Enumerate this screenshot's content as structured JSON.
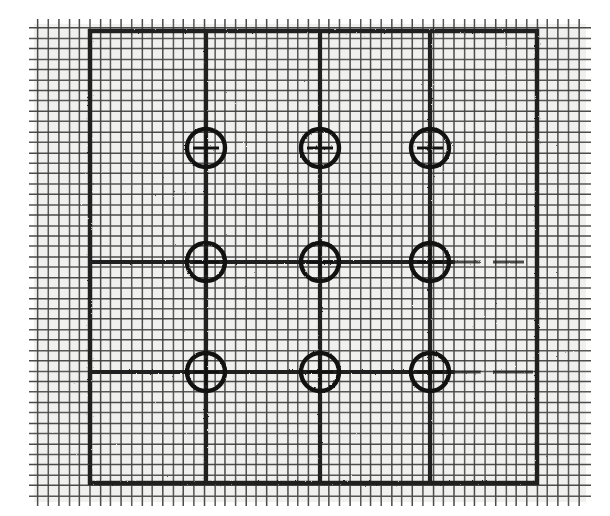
{
  "document": {
    "kind": "scanned-figure",
    "title": "Graph paper grid with 3x3 crosshair registration targets",
    "background_color": "#ffffff",
    "paper_color": "#f2f2f0",
    "ink_color": "#1a1a1a",
    "mid_ink_color": "#333333",
    "faint_ink_color": "#555555"
  },
  "canvas": {
    "width": 610,
    "height": 516
  },
  "grid": {
    "label": "fine-graph-grid",
    "x_start": 38,
    "x_end": 582,
    "y_start": 28,
    "y_end": 497,
    "spacing": 10.4,
    "line_color": "#3a3a3a",
    "line_width": 1.5,
    "tick_overhang": 9,
    "tick_color": "#2a2a2a"
  },
  "frame": {
    "label": "heavy-bounding-rectangle",
    "left": 90,
    "right": 537,
    "top": 31,
    "bottom": 483,
    "stroke": "#1a1a1a",
    "stroke_width": 4.5,
    "note": "Heavy border rectangle drawn over the fine grid"
  },
  "axes": {
    "label": "heavy-reference-lines",
    "stroke": "#1a1a1a",
    "stroke_width": 4.2,
    "verticals": [
      {
        "name": "vertical-axis-left",
        "x": 206,
        "y_top": 31,
        "y_bottom": 483
      },
      {
        "name": "vertical-axis-center",
        "x": 320,
        "y_top": 31,
        "y_bottom": 483
      },
      {
        "name": "vertical-axis-right",
        "x": 430,
        "y_top": 31,
        "y_bottom": 483
      }
    ],
    "horizontals": [
      {
        "name": "horizontal-axis-middle",
        "y": 262,
        "x_left": 90,
        "x_right": 524,
        "fade_from": 455
      },
      {
        "name": "horizontal-axis-bottom",
        "y": 372,
        "x_left": 90,
        "x_right": 536,
        "fade_from": 455
      }
    ]
  },
  "targets": {
    "label": "crosshair-registration-targets",
    "radius": 19,
    "stroke": "#111111",
    "stroke_width": 4.4,
    "crosshair_length": 26,
    "rows": [
      {
        "name": "target-row-top",
        "y": 148,
        "marks": [
          {
            "name": "target-top-left",
            "x": 206,
            "y": 148
          },
          {
            "name": "target-top-center",
            "x": 320,
            "y": 148
          },
          {
            "name": "target-top-right",
            "x": 430,
            "y": 148
          }
        ]
      },
      {
        "name": "target-row-middle",
        "y": 262,
        "marks": [
          {
            "name": "target-middle-left",
            "x": 206,
            "y": 262
          },
          {
            "name": "target-middle-center",
            "x": 320,
            "y": 262
          },
          {
            "name": "target-middle-right",
            "x": 430,
            "y": 262
          }
        ]
      },
      {
        "name": "target-row-bottom",
        "y": 372,
        "marks": [
          {
            "name": "target-bottom-left",
            "x": 206,
            "y": 372
          },
          {
            "name": "target-bottom-center",
            "x": 320,
            "y": 372
          },
          {
            "name": "target-bottom-right",
            "x": 430,
            "y": 372
          }
        ]
      }
    ]
  },
  "chart_data": {
    "type": "scatter",
    "subtitle": "",
    "xlabel": "",
    "ylabel": "",
    "grid": true,
    "legend": "none",
    "xlim": [
      0,
      3
    ],
    "ylim": [
      0,
      3
    ],
    "x": [
      1,
      2,
      3,
      1,
      2,
      3,
      1,
      2,
      3
    ],
    "y": [
      3,
      3,
      3,
      2,
      2,
      2,
      1,
      1,
      1
    ],
    "point_labels": [
      "target-top-left",
      "target-top-center",
      "target-top-right",
      "target-middle-left",
      "target-middle-center",
      "target-middle-right",
      "target-bottom-left",
      "target-bottom-center",
      "target-bottom-right"
    ],
    "marker": "circle-with-crosshair",
    "series": [
      {
        "name": "registration-targets",
        "values": [
          3,
          3,
          3,
          2,
          2,
          2,
          1,
          1,
          1
        ]
      }
    ]
  }
}
